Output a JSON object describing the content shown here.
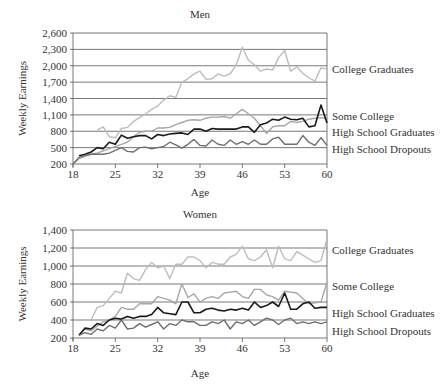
{
  "chart_data": [
    {
      "type": "line",
      "title": "Men",
      "xlabel": "Age",
      "ylabel": "Weekly Earnings",
      "ylim": [
        200,
        2600
      ],
      "yticks": [
        "200",
        "500",
        "800",
        "1,100",
        "1,400",
        "1,700",
        "2,000",
        "2,300",
        "2,600"
      ],
      "xlim": [
        18,
        60
      ],
      "xticks": [
        "18",
        "25",
        "32",
        "39",
        "46",
        "53",
        "60"
      ],
      "grid": true,
      "legend_position": "right (inline labels)",
      "series": [
        {
          "name": "College Graduates",
          "color": "#bdbdbd",
          "x": [
            22,
            23,
            24,
            25,
            26,
            27,
            28,
            29,
            30,
            31,
            32,
            33,
            34,
            35,
            36,
            37,
            38,
            39,
            40,
            41,
            42,
            43,
            44,
            45,
            46,
            47,
            48,
            49,
            50,
            51,
            52,
            53,
            54,
            55,
            56,
            57,
            58,
            59,
            60
          ],
          "values": [
            820,
            880,
            700,
            680,
            850,
            870,
            980,
            1050,
            1120,
            1200,
            1260,
            1370,
            1450,
            1420,
            1700,
            1760,
            1850,
            1900,
            1750,
            1760,
            1850,
            1810,
            1850,
            2020,
            2340,
            2100,
            2020,
            1900,
            1940,
            1920,
            2150,
            2280,
            1900,
            1980,
            1860,
            1780,
            1720,
            1960,
            1940
          ]
        },
        {
          "name": "Some College",
          "color": "#a6a6a6",
          "x": [
            18,
            19,
            20,
            21,
            22,
            23,
            24,
            25,
            26,
            27,
            28,
            29,
            30,
            31,
            32,
            33,
            34,
            35,
            36,
            37,
            38,
            39,
            40,
            41,
            42,
            43,
            44,
            45,
            46,
            47,
            48,
            49,
            50,
            51,
            52,
            53,
            54,
            55,
            56,
            57,
            58,
            59,
            60
          ],
          "values": [
            200,
            300,
            340,
            380,
            400,
            440,
            480,
            520,
            560,
            600,
            700,
            780,
            800,
            800,
            860,
            860,
            870,
            920,
            960,
            1000,
            1010,
            1000,
            1040,
            1060,
            1060,
            1070,
            1040,
            1120,
            1200,
            1120,
            1040,
            900,
            760,
            880,
            900,
            900,
            980,
            960,
            980,
            1020,
            1040,
            1050,
            1030
          ]
        },
        {
          "name": "High School Graduates",
          "color": "#1a1a1a",
          "x": [
            19,
            20,
            21,
            22,
            23,
            24,
            25,
            26,
            27,
            28,
            29,
            30,
            31,
            32,
            33,
            34,
            35,
            36,
            37,
            38,
            39,
            40,
            41,
            42,
            43,
            44,
            45,
            46,
            47,
            48,
            49,
            50,
            51,
            52,
            53,
            54,
            55,
            56,
            57,
            58,
            59,
            60
          ],
          "values": [
            350,
            380,
            420,
            500,
            480,
            600,
            560,
            730,
            670,
            700,
            720,
            720,
            660,
            740,
            720,
            750,
            760,
            770,
            740,
            840,
            840,
            800,
            850,
            840,
            840,
            840,
            840,
            880,
            880,
            780,
            920,
            950,
            1020,
            1000,
            1060,
            1020,
            1010,
            1040,
            880,
            900,
            1280,
            950
          ]
        },
        {
          "name": "High School Dropouts",
          "color": "#6e6e6e",
          "x": [
            18,
            19,
            20,
            21,
            22,
            23,
            24,
            25,
            26,
            27,
            28,
            29,
            30,
            31,
            32,
            33,
            34,
            35,
            36,
            37,
            38,
            39,
            40,
            41,
            42,
            43,
            44,
            45,
            46,
            47,
            48,
            49,
            50,
            51,
            52,
            53,
            54,
            55,
            56,
            57,
            58,
            59,
            60
          ],
          "values": [
            200,
            320,
            360,
            380,
            380,
            380,
            400,
            450,
            500,
            430,
            420,
            500,
            510,
            480,
            500,
            520,
            600,
            550,
            490,
            560,
            650,
            540,
            530,
            640,
            560,
            540,
            640,
            560,
            610,
            560,
            640,
            560,
            560,
            660,
            690,
            560,
            560,
            560,
            720,
            600,
            540,
            680,
            540
          ]
        }
      ]
    },
    {
      "type": "line",
      "title": "Women",
      "xlabel": "Age",
      "ylabel": "Weekly Earnings",
      "ylim": [
        200,
        1400
      ],
      "yticks": [
        "200",
        "400",
        "600",
        "800",
        "1,000",
        "1,200",
        "1,400"
      ],
      "xlim": [
        18,
        60
      ],
      "xticks": [
        "18",
        "25",
        "32",
        "39",
        "46",
        "53",
        "60"
      ],
      "grid": true,
      "legend_position": "right (inline labels)",
      "series": [
        {
          "name": "College Graduates",
          "color": "#bdbdbd",
          "x": [
            21,
            22,
            23,
            24,
            25,
            26,
            27,
            28,
            29,
            30,
            31,
            32,
            33,
            34,
            35,
            36,
            37,
            38,
            39,
            40,
            41,
            42,
            43,
            44,
            45,
            46,
            47,
            48,
            49,
            50,
            51,
            52,
            53,
            54,
            55,
            56,
            57,
            58,
            59,
            60
          ],
          "values": [
            400,
            540,
            560,
            640,
            720,
            700,
            920,
            860,
            840,
            960,
            1040,
            980,
            1000,
            860,
            1020,
            1020,
            1100,
            1100,
            1060,
            980,
            1040,
            1020,
            1020,
            1100,
            1130,
            1220,
            1080,
            1060,
            1100,
            1180,
            980,
            1220,
            1080,
            1060,
            1160,
            1120,
            1080,
            1040,
            1060,
            1300
          ]
        },
        {
          "name": "Some College",
          "color": "#a6a6a6",
          "x": [
            19,
            20,
            21,
            22,
            23,
            24,
            25,
            26,
            27,
            28,
            29,
            30,
            31,
            32,
            33,
            34,
            35,
            36,
            37,
            38,
            39,
            40,
            41,
            42,
            43,
            44,
            45,
            46,
            47,
            48,
            49,
            50,
            51,
            52,
            53,
            54,
            55,
            56,
            57,
            58,
            59,
            60
          ],
          "values": [
            240,
            300,
            280,
            330,
            380,
            400,
            440,
            540,
            520,
            520,
            580,
            580,
            580,
            660,
            640,
            620,
            580,
            800,
            650,
            690,
            600,
            640,
            660,
            640,
            700,
            710,
            720,
            660,
            640,
            740,
            740,
            680,
            660,
            620,
            720,
            710,
            700,
            640,
            580,
            590,
            600,
            820
          ]
        },
        {
          "name": "High School Graduates",
          "color": "#1a1a1a",
          "x": [
            19,
            20,
            21,
            22,
            23,
            24,
            25,
            26,
            27,
            28,
            29,
            30,
            31,
            32,
            33,
            34,
            35,
            36,
            37,
            38,
            39,
            40,
            41,
            42,
            43,
            44,
            45,
            46,
            47,
            48,
            49,
            50,
            51,
            52,
            53,
            54,
            55,
            56,
            57,
            58,
            59,
            60
          ],
          "values": [
            230,
            310,
            300,
            360,
            340,
            400,
            420,
            410,
            440,
            420,
            440,
            440,
            460,
            540,
            480,
            470,
            460,
            600,
            600,
            480,
            480,
            520,
            530,
            510,
            500,
            520,
            510,
            530,
            510,
            600,
            540,
            560,
            600,
            550,
            700,
            520,
            520,
            580,
            600,
            530,
            540,
            540
          ]
        },
        {
          "name": "High School Dropouts",
          "color": "#6e6e6e",
          "x": [
            19,
            20,
            21,
            22,
            23,
            24,
            25,
            26,
            27,
            28,
            29,
            30,
            31,
            32,
            33,
            34,
            35,
            36,
            37,
            38,
            39,
            40,
            41,
            42,
            43,
            44,
            45,
            46,
            47,
            48,
            49,
            50,
            51,
            52,
            53,
            54,
            55,
            56,
            57,
            58,
            59,
            60
          ],
          "values": [
            230,
            260,
            240,
            300,
            280,
            340,
            310,
            400,
            300,
            310,
            360,
            320,
            350,
            380,
            300,
            360,
            340,
            400,
            380,
            380,
            340,
            340,
            380,
            360,
            400,
            300,
            380,
            360,
            400,
            340,
            380,
            420,
            400,
            350,
            400,
            420,
            360,
            380,
            360,
            380,
            360,
            380
          ]
        }
      ]
    }
  ],
  "labels": {
    "men_title": "Men",
    "women_title": "Women",
    "xlabel": "Age",
    "ylabel": "Weekly Earnings"
  }
}
